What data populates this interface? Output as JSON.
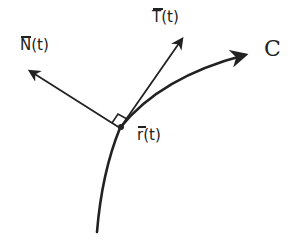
{
  "diagram": {
    "type": "tangent-normal-vectors-on-curve",
    "stroke_color": "#222222",
    "background": "#ffffff",
    "labels": {
      "normal": {
        "letter": "N",
        "arg": "(t)",
        "text": "N̄(t)"
      },
      "tangent": {
        "letter": "T",
        "arg": "(t)",
        "text": "T̄(t)"
      },
      "position": {
        "letter": "r",
        "arg": "(t)",
        "text": "r̄(t)"
      },
      "curve": {
        "text": "C"
      }
    },
    "elements": [
      {
        "name": "curve-C",
        "kind": "curve-with-arrow",
        "from": [
          97,
          232
        ],
        "through": [
          120,
          128
        ],
        "to": [
          245,
          55
        ]
      },
      {
        "name": "tangent-vector",
        "kind": "arrow",
        "from": [
          120,
          128
        ],
        "to": [
          183,
          37
        ]
      },
      {
        "name": "normal-vector",
        "kind": "arrow",
        "from": [
          120,
          128
        ],
        "to": [
          28,
          70
        ]
      },
      {
        "name": "right-angle-marker",
        "kind": "square",
        "at": [
          120,
          128
        ]
      },
      {
        "name": "point-r",
        "kind": "dot",
        "at": [
          120,
          128
        ]
      }
    ]
  }
}
